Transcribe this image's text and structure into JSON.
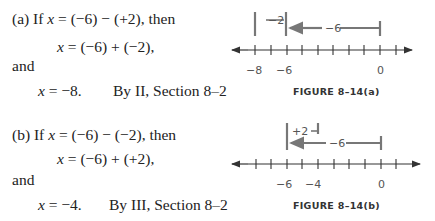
{
  "part_a": {
    "line1_prefix": "(a) If ",
    "line1_var": "x",
    "line1_rest": " = (−6) − (+2), then",
    "line2_var": "x",
    "line2_rest": " = (−6) + (−2),",
    "line3": "and",
    "line4_var": "x",
    "line4_rest": " = −8.",
    "reason": "By II, Section 8–2",
    "figure_caption": "FIGURE 8–14(a)",
    "figure": {
      "tick_labels": [
        "−8",
        "−6",
        "0"
      ],
      "arrow_short_label": "−2",
      "arrow_long_label": "−6"
    }
  },
  "part_b": {
    "line1_prefix": "(b) If ",
    "line1_var": "x",
    "line1_rest": " = (−6) − (−2), then",
    "line2_var": "x",
    "line2_rest": " = (−6) + (+2),",
    "line3": "and",
    "line4_var": "x",
    "line4_rest": " = −4.",
    "reason": "By III, Section 8–2",
    "figure_caption": "FIGURE 8–14(b)",
    "figure": {
      "tick_labels": [
        "−6",
        "−4",
        "0"
      ],
      "arrow_short_label": "+2",
      "arrow_long_label": "−6"
    }
  }
}
